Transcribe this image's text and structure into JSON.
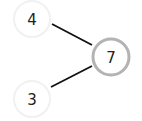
{
  "diagram": {
    "type": "number-bond",
    "whole": {
      "label": "7",
      "cx": 111,
      "cy": 57,
      "r": 18,
      "stroke": "#b3b3b3",
      "stroke_width": 3
    },
    "parts": [
      {
        "label": "4",
        "cx": 32,
        "cy": 19,
        "r": 18,
        "stroke": "#f1f1f1",
        "stroke_width": 2
      },
      {
        "label": "3",
        "cx": 32,
        "cy": 99,
        "r": 18,
        "stroke": "#f1f1f1",
        "stroke_width": 2
      }
    ],
    "edges": [
      {
        "from": "4",
        "to": "7"
      },
      {
        "from": "3",
        "to": "7"
      }
    ],
    "line_color": "#111111"
  }
}
